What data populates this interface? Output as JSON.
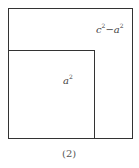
{
  "figure": {
    "outer_label": {
      "base1": "c",
      "exp1": "2",
      "op": "−",
      "base2": "a",
      "exp2": "2"
    },
    "inner_label": {
      "base": "a",
      "exp": "2"
    },
    "caption": "(2)"
  }
}
